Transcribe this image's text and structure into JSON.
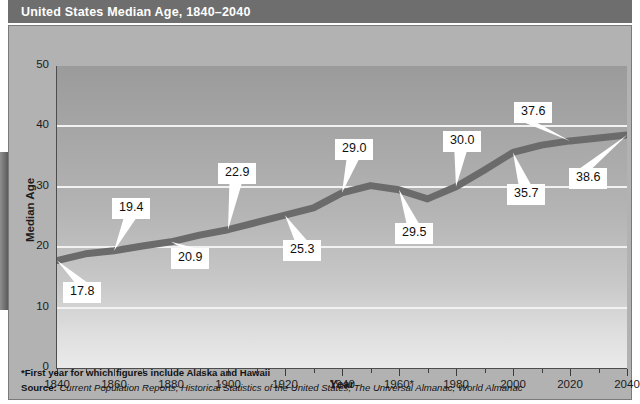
{
  "title": "United States Median Age, 1840–2040",
  "footnotes": {
    "star_note": "*First year for which figures include Alaska and Hawaii",
    "source_prefix": "Source:",
    "source_text": " Current Population Reports; Historical Statistics of the United States; The Universal Almanac; World Almanac"
  },
  "colors": {
    "title_band": "#6e6e6e",
    "panel": "#b2b2b2",
    "line": "#6b6b6b",
    "gridline": "#f2f2f2",
    "axis": "#4d4d4d",
    "callout_bg": "#ffffff",
    "text": "#1c1c1c"
  },
  "chart_data": {
    "type": "line",
    "title": "United States Median Age, 1840–2040",
    "xlabel": "Year",
    "ylabel": "Median Age",
    "xlim": [
      1840,
      2040
    ],
    "ylim": [
      0,
      50
    ],
    "xticks": [
      "1840",
      "1860",
      "1880",
      "1900",
      "1920",
      "1940",
      "1960*",
      "1980",
      "2000",
      "2020",
      "2040"
    ],
    "xtick_values": [
      1840,
      1860,
      1880,
      1900,
      1920,
      1940,
      1960,
      1980,
      2000,
      2020,
      2040
    ],
    "xtick_minor_step": 10,
    "yticks": [
      "0",
      "10",
      "20",
      "30",
      "40",
      "50"
    ],
    "ytick_values": [
      0,
      10,
      20,
      30,
      40,
      50
    ],
    "grid": "horizontal",
    "legend": "none",
    "series_name": "Median Age",
    "x": [
      1840,
      1850,
      1860,
      1870,
      1880,
      1890,
      1900,
      1910,
      1920,
      1930,
      1940,
      1950,
      1960,
      1970,
      1980,
      1990,
      2000,
      2010,
      2020,
      2030,
      2040
    ],
    "values": [
      17.8,
      18.9,
      19.4,
      20.2,
      20.9,
      22.0,
      22.9,
      24.1,
      25.3,
      26.5,
      29.0,
      30.2,
      29.5,
      28.0,
      30.0,
      32.8,
      35.7,
      36.9,
      37.6,
      38.1,
      38.6
    ],
    "data_labels": [
      {
        "label": "17.8",
        "x": 1840,
        "y": 17.8
      },
      {
        "label": "19.4",
        "x": 1860,
        "y": 19.4
      },
      {
        "label": "20.9",
        "x": 1880,
        "y": 20.9
      },
      {
        "label": "22.9",
        "x": 1900,
        "y": 22.9
      },
      {
        "label": "25.3",
        "x": 1920,
        "y": 25.3
      },
      {
        "label": "29.0",
        "x": 1940,
        "y": 29.0
      },
      {
        "label": "29.5",
        "x": 1960,
        "y": 29.5
      },
      {
        "label": "30.0",
        "x": 1980,
        "y": 30.0
      },
      {
        "label": "35.7",
        "x": 2000,
        "y": 35.7
      },
      {
        "label": "37.6",
        "x": 2020,
        "y": 37.6
      },
      {
        "label": "38.6",
        "x": 2040,
        "y": 38.6
      }
    ]
  }
}
